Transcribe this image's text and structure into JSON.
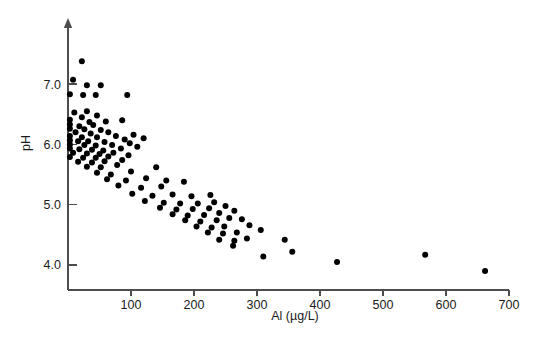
{
  "chart_data": {
    "type": "scatter",
    "title": "",
    "xlabel": "Al (µg/L)",
    "ylabel": "pH",
    "xlim": [
      0,
      700
    ],
    "ylim": [
      3.6,
      7.6
    ],
    "grid": false,
    "legend": null,
    "xticks": [
      100,
      200,
      300,
      400,
      500,
      600,
      700
    ],
    "xtick_labels": [
      "100",
      "200",
      "300",
      "400",
      "500",
      "600",
      "700"
    ],
    "yticks": [
      4.0,
      5.0,
      6.0,
      7.0
    ],
    "ytick_labels": [
      "4.0",
      "5.0",
      "6.0",
      "7.0"
    ],
    "marker": "filled-circle",
    "marker_color": "#000000",
    "marker_size_px": 6,
    "n_points": 118,
    "points": [
      [
        22,
        7.38
      ],
      [
        8,
        7.07
      ],
      [
        3,
        6.83
      ],
      [
        30,
        6.98
      ],
      [
        52,
        6.98
      ],
      [
        24,
        6.82
      ],
      [
        44,
        6.82
      ],
      [
        94,
        6.82
      ],
      [
        10,
        6.53
      ],
      [
        30,
        6.55
      ],
      [
        22,
        6.45
      ],
      [
        46,
        6.48
      ],
      [
        3,
        6.41
      ],
      [
        34,
        6.37
      ],
      [
        60,
        6.38
      ],
      [
        3,
        6.33
      ],
      [
        18,
        6.3
      ],
      [
        40,
        6.32
      ],
      [
        86,
        6.4
      ],
      [
        3,
        6.26
      ],
      [
        26,
        6.25
      ],
      [
        52,
        6.24
      ],
      [
        12,
        6.2
      ],
      [
        36,
        6.18
      ],
      [
        64,
        6.2
      ],
      [
        3,
        6.14
      ],
      [
        22,
        6.12
      ],
      [
        46,
        6.12
      ],
      [
        76,
        6.14
      ],
      [
        104,
        6.16
      ],
      [
        3,
        6.07
      ],
      [
        16,
        6.05
      ],
      [
        32,
        6.05
      ],
      [
        58,
        6.04
      ],
      [
        90,
        6.08
      ],
      [
        120,
        6.1
      ],
      [
        3,
        6.0
      ],
      [
        26,
        5.99
      ],
      [
        44,
        5.98
      ],
      [
        70,
        5.99
      ],
      [
        98,
        6.02
      ],
      [
        3,
        5.93
      ],
      [
        18,
        5.92
      ],
      [
        38,
        5.91
      ],
      [
        56,
        5.9
      ],
      [
        84,
        5.93
      ],
      [
        110,
        5.96
      ],
      [
        8,
        5.86
      ],
      [
        30,
        5.85
      ],
      [
        50,
        5.84
      ],
      [
        72,
        5.86
      ],
      [
        3,
        5.79
      ],
      [
        24,
        5.78
      ],
      [
        44,
        5.78
      ],
      [
        64,
        5.8
      ],
      [
        96,
        5.82
      ],
      [
        16,
        5.71
      ],
      [
        38,
        5.7
      ],
      [
        58,
        5.72
      ],
      [
        86,
        5.74
      ],
      [
        30,
        5.63
      ],
      [
        52,
        5.62
      ],
      [
        78,
        5.66
      ],
      [
        46,
        5.53
      ],
      [
        68,
        5.5
      ],
      [
        100,
        5.55
      ],
      [
        140,
        5.62
      ],
      [
        62,
        5.42
      ],
      [
        92,
        5.4
      ],
      [
        124,
        5.44
      ],
      [
        156,
        5.4
      ],
      [
        80,
        5.32
      ],
      [
        116,
        5.28
      ],
      [
        148,
        5.3
      ],
      [
        184,
        5.38
      ],
      [
        102,
        5.18
      ],
      [
        134,
        5.15
      ],
      [
        166,
        5.17
      ],
      [
        196,
        5.14
      ],
      [
        226,
        5.16
      ],
      [
        122,
        5.06
      ],
      [
        152,
        5.03
      ],
      [
        178,
        5.02
      ],
      [
        206,
        5.02
      ],
      [
        232,
        5.04
      ],
      [
        146,
        4.95
      ],
      [
        172,
        4.92
      ],
      [
        198,
        4.93
      ],
      [
        224,
        4.94
      ],
      [
        250,
        4.98
      ],
      [
        166,
        4.84
      ],
      [
        190,
        4.82
      ],
      [
        216,
        4.83
      ],
      [
        240,
        4.86
      ],
      [
        264,
        4.9
      ],
      [
        186,
        4.74
      ],
      [
        210,
        4.72
      ],
      [
        236,
        4.74
      ],
      [
        256,
        4.78
      ],
      [
        276,
        4.76
      ],
      [
        204,
        4.64
      ],
      [
        228,
        4.62
      ],
      [
        248,
        4.64
      ],
      [
        288,
        4.66
      ],
      [
        222,
        4.54
      ],
      [
        246,
        4.52
      ],
      [
        268,
        4.54
      ],
      [
        306,
        4.58
      ],
      [
        240,
        4.42
      ],
      [
        264,
        4.4
      ],
      [
        284,
        4.44
      ],
      [
        344,
        4.42
      ],
      [
        262,
        4.32
      ],
      [
        310,
        4.14
      ],
      [
        356,
        4.22
      ],
      [
        427,
        4.05
      ],
      [
        567,
        4.17
      ],
      [
        662,
        3.9
      ]
    ]
  },
  "plot_geometry": {
    "x_axis_pixel_start": 68,
    "x_axis_pixel_end": 509,
    "y_axis_pixel_baseline": 290,
    "y_value_at_baseline": 3.585,
    "pixels_per_100_al": 63,
    "pixels_per_ph_unit": 60.3
  }
}
